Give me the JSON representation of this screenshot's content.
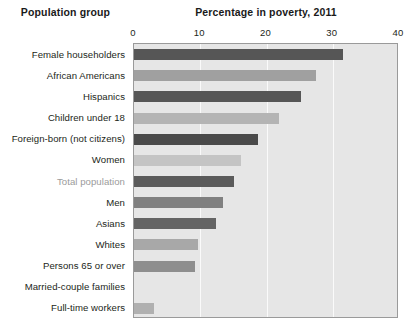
{
  "header": {
    "group_title": "Population group",
    "chart_title": "Percentage in poverty, 2011"
  },
  "chart_data": {
    "type": "bar",
    "orientation": "horizontal",
    "title": "Percentage in poverty, 2011",
    "xlabel": "",
    "ylabel": "Population group",
    "xlim": [
      0,
      40
    ],
    "xticks": [
      0,
      10,
      20,
      30,
      40
    ],
    "xtick_labels": [
      "0",
      "10",
      "20",
      "30",
      "40"
    ],
    "grid": true,
    "gridline_color": "#fafafa",
    "plot_background": "#e6e6e6",
    "legend": null,
    "categories": [
      "Female householders",
      "African Americans",
      "Hispanics",
      "Children under 18",
      "Foreign-born (not citizens)",
      "Women",
      "Total population",
      "Men",
      "Asians",
      "Whites",
      "Persons 65 or over",
      "Married-couple families",
      "Full-time workers"
    ],
    "values": [
      31.6,
      27.5,
      25.2,
      21.9,
      18.7,
      16.2,
      15.1,
      13.4,
      12.4,
      9.7,
      9.2,
      0.0,
      3.0
    ],
    "bar_colors": [
      "#565656",
      "#a0a0a0",
      "#565656",
      "#b4b4b4",
      "#4a4a4a",
      "#c4c4c4",
      "#5b5b5b",
      "#808080",
      "#646464",
      "#a8a8a8",
      "#8e8e8e",
      "#e6e6e6",
      "#b0b0b0"
    ],
    "highlight_category": "Total population",
    "highlight_label_color": "#9b9b9b"
  }
}
